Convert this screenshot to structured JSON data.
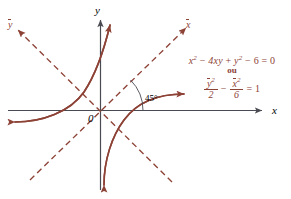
{
  "figure": {
    "colors": {
      "curve": "#8d4236",
      "axis": "#4a4a52",
      "text": "#000000",
      "equation": "#8d4236",
      "background": "#ffffff"
    },
    "axes": {
      "x_label": "x",
      "y_label": "y",
      "x_bar_label": "x",
      "y_bar_label": "y",
      "origin_label": "0"
    },
    "angle": {
      "value": "45",
      "degree_symbol": "°",
      "label": "45°"
    },
    "equation": {
      "line1": {
        "x": "x",
        "x_exp": "2",
        "minus1": "−",
        "term2": "4xy",
        "plus": "+",
        "y": "y",
        "y_exp": "2",
        "minus2": "−",
        "six": "6",
        "equals": "=",
        "zero": "0",
        "full": "x² − 4xy + y² − 6 = 0"
      },
      "connector": "ou",
      "line2": {
        "num1_base": "y",
        "num1_exp": "2",
        "den1": "2",
        "operator": "−",
        "num2_base": "x",
        "num2_exp": "2",
        "den2": "6",
        "equals": "=",
        "rhs": "1",
        "full": "ȳ²/2 − x̄²/6 = 1"
      }
    },
    "curves": {
      "hyperbola_branch_upper_left": "branch opening toward upper-left along rotated y-axis",
      "hyperbola_branch_lower_right": "branch opening toward lower-right along rotated y-axis",
      "asymptote_1": "dashed rotated x-axis at 45 degrees",
      "asymptote_2": "dashed rotated y-axis at 135 degrees"
    }
  }
}
